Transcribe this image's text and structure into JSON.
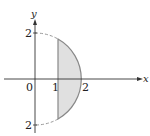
{
  "diagram": {
    "type": "region-plot",
    "axes": {
      "x_label": "x",
      "y_label": "y"
    },
    "ticks": {
      "origin": "0",
      "x1": "1",
      "x2": "2",
      "y_top": "2",
      "y_bottom": "2"
    },
    "curve": "semicircle x^2 + y^2 = 4, x >= 0 (dashed outside region)",
    "region": "shaded between x = 1 and the circle, x from 1 to 2",
    "colors": {
      "fill": "#e0e0e0",
      "boundary": "#888888",
      "axes": "#333333",
      "dashed": "#999999"
    }
  }
}
